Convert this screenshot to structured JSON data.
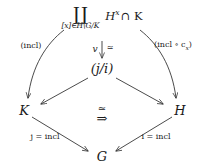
{
  "figure": {
    "kind": "commutative-diagram",
    "background": "#ffffff",
    "ink": "#1a1a1a"
  },
  "nodes": {
    "coproduct": {
      "symbol": "∐",
      "subscript": "[x]∈H\\G/K",
      "body_prefix": "H",
      "body_exponent": "x",
      "body_suffix": "∩ K"
    },
    "comma_object": "(j/i)",
    "left": "K",
    "right": "H",
    "bottom": "G"
  },
  "arrow_labels": {
    "top_left": "(incl)",
    "top_right_open": "(incl ∘ c",
    "top_right_sub": "x",
    "top_right_close": ")",
    "vertical_name": "v",
    "vertical_equiv": "≃",
    "bottom_left": "j = incl",
    "bottom_right": "i = incl"
  },
  "two_cell": {
    "equiv": "≃",
    "arrow": "⇒"
  }
}
